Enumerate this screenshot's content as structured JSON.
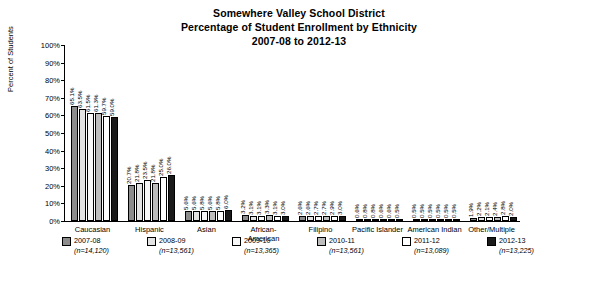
{
  "title": {
    "line1": "Somewhere Valley School District",
    "line2": "Percentage of Student Enrollment by Ethnicity",
    "line3": "2007-08 to 2012-13"
  },
  "chart_data": {
    "type": "bar",
    "title": "Somewhere Valley School District Percentage of Student Enrollment by Ethnicity 2007-08 to 2012-13",
    "xlabel": "",
    "ylabel": "Percent of Students",
    "ylim": [
      0,
      100
    ],
    "yticks": [
      "0%",
      "10%",
      "20%",
      "30%",
      "40%",
      "50%",
      "60%",
      "70%",
      "80%",
      "90%",
      "100%"
    ],
    "grid": false,
    "legend_position": "bottom",
    "categories": [
      "Caucasian",
      "Hispanic",
      "Asian",
      "African-American",
      "Filipino",
      "Pacific Islander",
      "American Indian",
      "Other/Multiple"
    ],
    "series": [
      {
        "name": "2007-08",
        "n": "(n=14,120)",
        "color": "#8c8c8c",
        "values": [
          65.1,
          20.7,
          5.6,
          3.2,
          2.6,
          0.6,
          0.5,
          1.9
        ],
        "labels": [
          "65.1%",
          "20.7%",
          "5.6%",
          "3.2%",
          "2.6%",
          "0.6%",
          "0.5%",
          "1.9%"
        ]
      },
      {
        "name": "2008-09",
        "n": "(n=13,561)",
        "color": "#e3e3e3",
        "values": [
          63.5,
          21.8,
          5.6,
          3.1,
          2.6,
          0.8,
          0.5,
          2.2
        ],
        "labels": [
          "63.5%",
          "21.8%",
          "5.6%",
          "3.1%",
          "2.6%",
          "0.8%",
          "0.5%",
          "2.2%"
        ]
      },
      {
        "name": "2009-10",
        "n": "(n=13,365)",
        "color": "#f7f7f7",
        "values": [
          61.5,
          23.5,
          5.8,
          3.1,
          2.7,
          0.8,
          0.5,
          2.1
        ],
        "labels": [
          "61.5%",
          "23.5%",
          "5.8%",
          "3.1%",
          "2.7%",
          "0.8%",
          "0.5%",
          "2.1%"
        ]
      },
      {
        "name": "2010-11",
        "n": "(n=13,561)",
        "color": "#bdbdbd",
        "values": [
          61.3,
          21.8,
          5.6,
          3.3,
          2.7,
          0.6,
          0.5,
          2.4
        ],
        "labels": [
          "61.3%",
          "21.8%",
          "5.6%",
          "3.3%",
          "2.7%",
          "0.6%",
          "0.5%",
          "2.4%"
        ]
      },
      {
        "name": "2011-12",
        "n": "(n=13,089)",
        "color": "#ffffff",
        "values": [
          59.7,
          25.0,
          5.8,
          3.1,
          2.9,
          0.6,
          0.5,
          2.8
        ],
        "labels": [
          "59.7%",
          "25.0%",
          "5.8%",
          "3.1%",
          "2.9%",
          "0.6%",
          "0.5%",
          "2.8%"
        ]
      },
      {
        "name": "2012-13",
        "n": "(n=13,225)",
        "color": "#1a1a1a",
        "values": [
          59.0,
          26.0,
          6.0,
          3.0,
          3.0,
          0.5,
          0.5,
          2.0
        ],
        "labels": [
          "59.0%",
          "26.0%",
          "6.0%",
          "3.0%",
          "3.0%",
          "0.5%",
          "0.5%",
          "2.0%"
        ]
      }
    ]
  }
}
